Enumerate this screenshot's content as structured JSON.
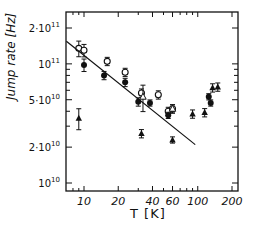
{
  "chart_data": {
    "type": "scatter",
    "title": "",
    "xlabel": "T [K]",
    "ylabel": "Jump rate [Hz]",
    "xscale": "log",
    "yscale": "log",
    "xlim": [
      7,
      210
    ],
    "ylim": [
      9000000000,
      250000000000
    ],
    "xticks": [
      10,
      20,
      40,
      60,
      100,
      200
    ],
    "xtick_labels": [
      "10",
      "20",
      "40",
      "60",
      "100",
      "200"
    ],
    "yticks": [
      10000000000,
      20000000000,
      50000000000,
      100000000000,
      200000000000
    ],
    "ytick_labels": [
      "10^10",
      "2·10^10",
      "5·10^10",
      "10^11",
      "2·10^11"
    ],
    "grid": false,
    "legend": null,
    "series": [
      {
        "name": "open circles",
        "marker": "open-circle",
        "points": [
          [
            9,
            135000000000
          ],
          [
            10,
            130000000000
          ],
          [
            16,
            105000000000
          ],
          [
            23,
            85000000000
          ],
          [
            32,
            57000000000
          ],
          [
            45,
            55000000000
          ],
          [
            55,
            40000000000
          ],
          [
            60,
            42000000000
          ]
        ],
        "yerr_frac": [
          0.15,
          0.12,
          0.08,
          0.08,
          0.08,
          0.08,
          0.08,
          0.08
        ]
      },
      {
        "name": "filled circles",
        "marker": "filled-circle",
        "points": [
          [
            10,
            98000000000
          ],
          [
            15,
            80000000000
          ],
          [
            23,
            70000000000
          ],
          [
            30,
            48000000000
          ],
          [
            38,
            47000000000
          ],
          [
            55,
            37000000000
          ],
          [
            125,
            53000000000
          ],
          [
            130,
            47000000000
          ]
        ],
        "yerr_frac": [
          0.12,
          0.08,
          0.08,
          0.08,
          0.06,
          0.06,
          0.06,
          0.06
        ]
      },
      {
        "name": "filled triangles",
        "marker": "filled-triangle",
        "points": [
          [
            9,
            35000000000
          ],
          [
            32,
            26000000000
          ],
          [
            60,
            23000000000
          ],
          [
            90,
            38000000000
          ],
          [
            115,
            39000000000
          ],
          [
            135,
            63000000000
          ],
          [
            150,
            64000000000
          ]
        ],
        "yerr_frac": [
          0.2,
          0.08,
          0.06,
          0.08,
          0.08,
          0.08,
          0.08
        ]
      },
      {
        "name": "open triangles",
        "marker": "open-triangle",
        "points": [
          [
            33,
            53000000000
          ],
          [
            60,
            42000000000
          ]
        ],
        "yerr_frac": [
          0.25,
          0.08
        ]
      },
      {
        "name": "fit line",
        "marker": "line",
        "points": [
          [
            7,
            155000000000
          ],
          [
            95,
            21000000000
          ]
        ]
      }
    ]
  },
  "labels": {
    "ylabel": "Jump rate [Hz]",
    "xlabel": "T [K]"
  }
}
